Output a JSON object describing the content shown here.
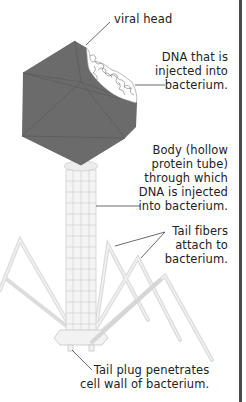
{
  "diagram": {
    "colors": {
      "head": "#6b6b6b",
      "head_edge": "#5a5a5a",
      "dna": "#ffffff",
      "tail": "#e4e4e4",
      "line": "#444444",
      "border": "#4a4a4a"
    },
    "labels": {
      "viral_head": {
        "lines": [
          "viral head"
        ]
      },
      "dna": {
        "lines": [
          "DNA that is",
          "injected into",
          "bacterium."
        ]
      },
      "body": {
        "lines": [
          "Body (hollow",
          "protein tube)",
          "through which",
          "DNA is injected",
          "into bacterium."
        ]
      },
      "tail_fibers": {
        "lines": [
          "Tail fibers",
          "attach to",
          "bacterium."
        ]
      },
      "tail_plug": {
        "lines": [
          "Tail plug penetrates",
          "cell wall of bacterium."
        ]
      }
    }
  }
}
